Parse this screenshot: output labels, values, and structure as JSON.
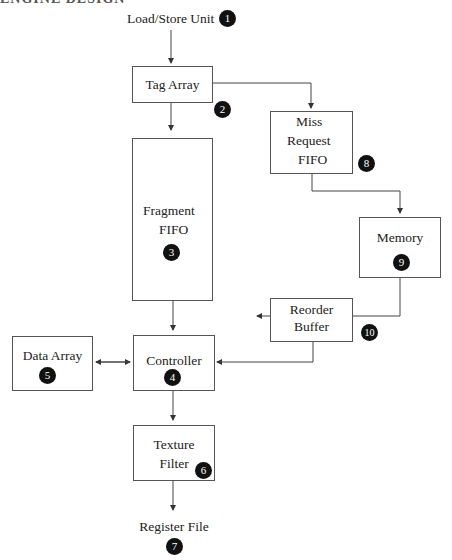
{
  "header": {
    "cut_text": "ENGINE DESIGN"
  },
  "nodes": {
    "lsu": {
      "label": "Load/Store Unit",
      "num": "1"
    },
    "tag": {
      "label": "Tag Array",
      "num": "2"
    },
    "frag": {
      "line1": "Fragment",
      "line2": "FIFO",
      "num": "3"
    },
    "ctrl": {
      "label": "Controller",
      "num": "4"
    },
    "data": {
      "label": "Data Array",
      "num": "5"
    },
    "tex": {
      "line1": "Texture",
      "line2": "Filter",
      "num": "6"
    },
    "reg": {
      "label": "Register File",
      "num": "7"
    },
    "miss": {
      "line1": "Miss",
      "line2": "Request",
      "line3": "FIFO",
      "num": "8"
    },
    "mem": {
      "label": "Memory",
      "num": "9"
    },
    "rob": {
      "line1": "Reorder",
      "line2": "Buffer",
      "num": "10"
    }
  }
}
